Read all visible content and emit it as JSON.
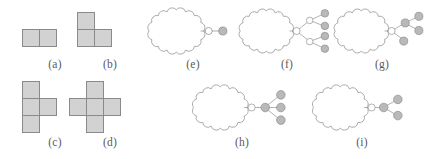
{
  "figure": {
    "caption_style": "parenthesized-lowercase-letters",
    "background_color": "#ffffff",
    "panel_count": 9
  },
  "style": {
    "cell_fill": "#d2d2d2",
    "cell_stroke": "#8a8a8a",
    "cloud_stroke": "#8a8a8a",
    "cloud_fill": "#ffffff",
    "edge_stroke": "#8a8a8a",
    "node_white_fill": "#ffffff",
    "node_gray_fill": "#b9b9b9",
    "node_stroke": "#8a8a8a",
    "label_color": "#5a5a5a"
  },
  "panels": [
    {
      "id": "a",
      "label": "(a)",
      "kind": "polyomino",
      "name": "domino",
      "cells": [
        [
          0,
          0
        ],
        [
          1,
          0
        ]
      ],
      "cell_count": 2
    },
    {
      "id": "b",
      "label": "(b)",
      "kind": "polyomino",
      "name": "l-tromino",
      "cells": [
        [
          0,
          0
        ],
        [
          0,
          1
        ],
        [
          1,
          1
        ]
      ],
      "cell_count": 3
    },
    {
      "id": "c",
      "label": "(c)",
      "kind": "polyomino",
      "name": "t-tetromino",
      "cells": [
        [
          0,
          0
        ],
        [
          0,
          1
        ],
        [
          1,
          1
        ],
        [
          0,
          2
        ]
      ],
      "cell_count": 4
    },
    {
      "id": "d",
      "label": "(d)",
      "kind": "polyomino",
      "name": "plus-pentomino",
      "cells": [
        [
          1,
          0
        ],
        [
          0,
          1
        ],
        [
          1,
          1
        ],
        [
          2,
          1
        ],
        [
          1,
          2
        ]
      ],
      "cell_count": 5
    },
    {
      "id": "e",
      "label": "(e)",
      "kind": "graph",
      "name": "cloud-with-single-pendant",
      "nodes": [
        {
          "id": "r",
          "type": "white",
          "x": 118,
          "y": 46
        },
        {
          "id": "n1",
          "type": "gray",
          "x": 148,
          "y": 46
        }
      ],
      "edges": [
        [
          "cloud",
          "r"
        ],
        [
          "r",
          "n1"
        ]
      ],
      "white_node_count": 1,
      "gray_node_count": 1
    },
    {
      "id": "f",
      "label": "(f)",
      "kind": "graph",
      "name": "cloud-with-binary-tree",
      "nodes": [
        {
          "id": "r",
          "type": "white",
          "x": 116,
          "y": 46
        },
        {
          "id": "a",
          "type": "white",
          "x": 141,
          "y": 27
        },
        {
          "id": "b",
          "type": "white",
          "x": 141,
          "y": 65
        },
        {
          "id": "a1",
          "type": "gray",
          "x": 167,
          "y": 16
        },
        {
          "id": "a2",
          "type": "gray",
          "x": 167,
          "y": 37
        },
        {
          "id": "b1",
          "type": "gray",
          "x": 167,
          "y": 55
        },
        {
          "id": "b2",
          "type": "gray",
          "x": 167,
          "y": 76
        }
      ],
      "edges": [
        [
          "cloud",
          "r"
        ],
        [
          "r",
          "a"
        ],
        [
          "r",
          "b"
        ],
        [
          "a",
          "a1"
        ],
        [
          "a",
          "a2"
        ],
        [
          "b",
          "b1"
        ],
        [
          "b",
          "b2"
        ]
      ],
      "white_node_count": 3,
      "gray_node_count": 4
    },
    {
      "id": "g",
      "label": "(g)",
      "kind": "graph",
      "name": "cloud-with-branching-gray-tree",
      "nodes": [
        {
          "id": "r",
          "type": "white",
          "x": 116,
          "y": 46
        },
        {
          "id": "u",
          "type": "gray",
          "x": 142,
          "y": 32
        },
        {
          "id": "v",
          "type": "gray",
          "x": 142,
          "y": 62
        },
        {
          "id": "u1",
          "type": "gray",
          "x": 168,
          "y": 22
        },
        {
          "id": "u2",
          "type": "gray",
          "x": 168,
          "y": 45
        }
      ],
      "edges": [
        [
          "cloud",
          "r"
        ],
        [
          "r",
          "u"
        ],
        [
          "r",
          "v"
        ],
        [
          "u",
          "u1"
        ],
        [
          "u",
          "u2"
        ]
      ],
      "white_node_count": 1,
      "gray_node_count": 4
    },
    {
      "id": "h",
      "label": "(h)",
      "kind": "graph",
      "name": "cloud-with-gray-star-three-leaves",
      "nodes": [
        {
          "id": "r",
          "type": "white",
          "x": 118,
          "y": 46
        },
        {
          "id": "c",
          "type": "gray",
          "x": 143,
          "y": 46
        },
        {
          "id": "l1",
          "type": "gray",
          "x": 172,
          "y": 25
        },
        {
          "id": "l2",
          "type": "gray",
          "x": 172,
          "y": 46
        },
        {
          "id": "l3",
          "type": "gray",
          "x": 172,
          "y": 67
        }
      ],
      "edges": [
        [
          "cloud",
          "r"
        ],
        [
          "r",
          "c"
        ],
        [
          "c",
          "l1"
        ],
        [
          "c",
          "l2"
        ],
        [
          "c",
          "l3"
        ]
      ],
      "white_node_count": 1,
      "gray_node_count": 4
    },
    {
      "id": "i",
      "label": "(i)",
      "kind": "graph",
      "name": "cloud-with-gray-star-two-leaves",
      "nodes": [
        {
          "id": "r",
          "type": "white",
          "x": 118,
          "y": 46
        },
        {
          "id": "c",
          "type": "gray",
          "x": 140,
          "y": 46
        },
        {
          "id": "l1",
          "type": "gray",
          "x": 166,
          "y": 33
        },
        {
          "id": "l2",
          "type": "gray",
          "x": 166,
          "y": 59
        }
      ],
      "edges": [
        [
          "cloud",
          "r"
        ],
        [
          "r",
          "c"
        ],
        [
          "c",
          "l1"
        ],
        [
          "c",
          "l2"
        ]
      ],
      "white_node_count": 1,
      "gray_node_count": 3
    }
  ]
}
